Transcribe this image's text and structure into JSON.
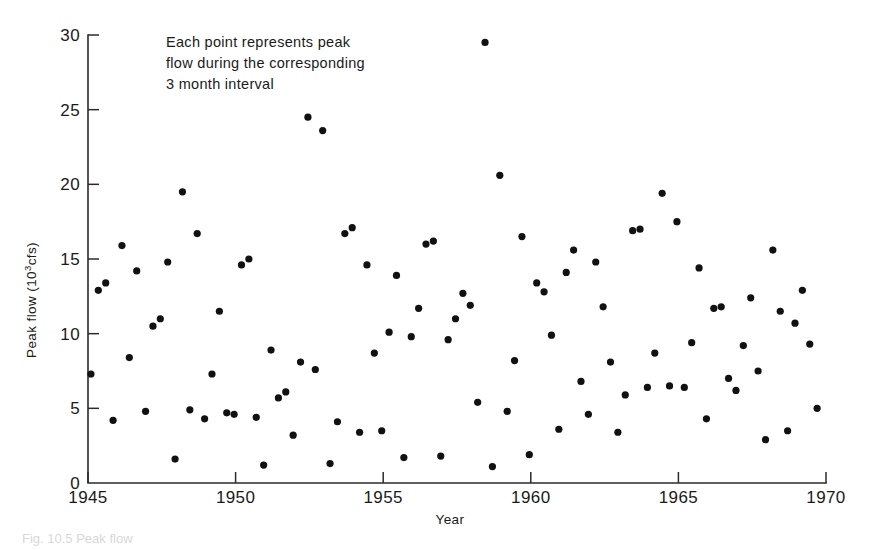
{
  "figure": {
    "caption_partial": "Fig. 10.5  Peak flow",
    "background": "#ffffff",
    "point_color": "#111111",
    "axis_color": "#2b2b2b"
  },
  "annotation": {
    "line1": "Each point represents peak",
    "line2": "flow during the corresponding",
    "line3": "3 month interval"
  },
  "axes": {
    "xlabel": "Year",
    "ylabel_prefix": "Peak flow (10",
    "ylabel_sup": "3",
    "ylabel_suffix": "cfs)",
    "xticks": [
      "1945",
      "1950",
      "1955",
      "1960",
      "1965",
      "1970"
    ],
    "yticks": [
      "0",
      "5",
      "10",
      "15",
      "20",
      "25",
      "30"
    ]
  },
  "chart_data": {
    "type": "scatter",
    "title": "",
    "xlabel": "Year",
    "ylabel": "Peak flow (10^3 cfs)",
    "xlim": [
      1945,
      1970
    ],
    "ylim": [
      0,
      30
    ],
    "xtick_values": [
      1945,
      1950,
      1955,
      1960,
      1965,
      1970
    ],
    "ytick_values": [
      0,
      5,
      10,
      15,
      20,
      25,
      30
    ],
    "grid": false,
    "legend": null,
    "annotation": "Each point represents peak flow during the corresponding 3 month interval",
    "series": [
      {
        "name": "Peak flow",
        "marker": "filled-circle",
        "color": "#111111",
        "points": [
          [
            1945.1,
            7.3
          ],
          [
            1945.35,
            12.9
          ],
          [
            1945.6,
            13.4
          ],
          [
            1945.85,
            4.2
          ],
          [
            1946.15,
            15.9
          ],
          [
            1946.4,
            8.4
          ],
          [
            1946.65,
            14.2
          ],
          [
            1946.95,
            4.8
          ],
          [
            1947.2,
            10.5
          ],
          [
            1947.45,
            11.0
          ],
          [
            1947.7,
            14.8
          ],
          [
            1947.95,
            1.6
          ],
          [
            1948.2,
            19.5
          ],
          [
            1948.45,
            4.9
          ],
          [
            1948.7,
            16.7
          ],
          [
            1948.95,
            4.3
          ],
          [
            1949.2,
            7.3
          ],
          [
            1949.45,
            11.5
          ],
          [
            1949.7,
            4.7
          ],
          [
            1949.95,
            4.6
          ],
          [
            1950.2,
            14.6
          ],
          [
            1950.45,
            15.0
          ],
          [
            1950.7,
            4.4
          ],
          [
            1950.95,
            1.2
          ],
          [
            1951.2,
            8.9
          ],
          [
            1951.45,
            5.7
          ],
          [
            1951.7,
            6.1
          ],
          [
            1951.95,
            3.2
          ],
          [
            1952.2,
            8.1
          ],
          [
            1952.45,
            24.5
          ],
          [
            1952.7,
            7.6
          ],
          [
            1952.95,
            23.6
          ],
          [
            1953.2,
            1.3
          ],
          [
            1953.45,
            4.1
          ],
          [
            1953.7,
            16.7
          ],
          [
            1953.95,
            17.1
          ],
          [
            1954.2,
            3.4
          ],
          [
            1954.45,
            14.6
          ],
          [
            1954.7,
            8.7
          ],
          [
            1954.95,
            3.5
          ],
          [
            1955.2,
            10.1
          ],
          [
            1955.45,
            13.9
          ],
          [
            1955.7,
            1.7
          ],
          [
            1955.95,
            9.8
          ],
          [
            1956.2,
            11.7
          ],
          [
            1956.45,
            16.0
          ],
          [
            1956.7,
            16.2
          ],
          [
            1956.95,
            1.8
          ],
          [
            1957.2,
            9.6
          ],
          [
            1957.45,
            11.0
          ],
          [
            1957.7,
            12.7
          ],
          [
            1957.95,
            11.9
          ],
          [
            1958.2,
            5.4
          ],
          [
            1958.45,
            29.5
          ],
          [
            1958.7,
            1.1
          ],
          [
            1958.95,
            20.6
          ],
          [
            1959.2,
            4.8
          ],
          [
            1959.45,
            8.2
          ],
          [
            1959.7,
            16.5
          ],
          [
            1959.95,
            1.9
          ],
          [
            1960.2,
            13.4
          ],
          [
            1960.45,
            12.8
          ],
          [
            1960.7,
            9.9
          ],
          [
            1960.95,
            3.6
          ],
          [
            1961.2,
            14.1
          ],
          [
            1961.45,
            15.6
          ],
          [
            1961.7,
            6.8
          ],
          [
            1961.95,
            4.6
          ],
          [
            1962.2,
            14.8
          ],
          [
            1962.45,
            11.8
          ],
          [
            1962.7,
            8.1
          ],
          [
            1962.95,
            3.4
          ],
          [
            1963.2,
            5.9
          ],
          [
            1963.45,
            16.9
          ],
          [
            1963.7,
            17.0
          ],
          [
            1963.95,
            6.4
          ],
          [
            1964.2,
            8.7
          ],
          [
            1964.45,
            19.4
          ],
          [
            1964.7,
            6.5
          ],
          [
            1964.95,
            17.5
          ],
          [
            1965.2,
            6.4
          ],
          [
            1965.45,
            9.4
          ],
          [
            1965.7,
            14.4
          ],
          [
            1965.95,
            4.3
          ],
          [
            1966.2,
            11.7
          ],
          [
            1966.45,
            11.8
          ],
          [
            1966.7,
            7.0
          ],
          [
            1966.95,
            6.2
          ],
          [
            1967.2,
            9.2
          ],
          [
            1967.45,
            12.4
          ],
          [
            1967.7,
            7.5
          ],
          [
            1967.95,
            2.9
          ],
          [
            1968.2,
            15.6
          ],
          [
            1968.45,
            11.5
          ],
          [
            1968.7,
            3.5
          ],
          [
            1968.95,
            10.7
          ],
          [
            1969.2,
            12.9
          ],
          [
            1969.45,
            9.3
          ],
          [
            1969.7,
            5.0
          ]
        ]
      }
    ]
  }
}
